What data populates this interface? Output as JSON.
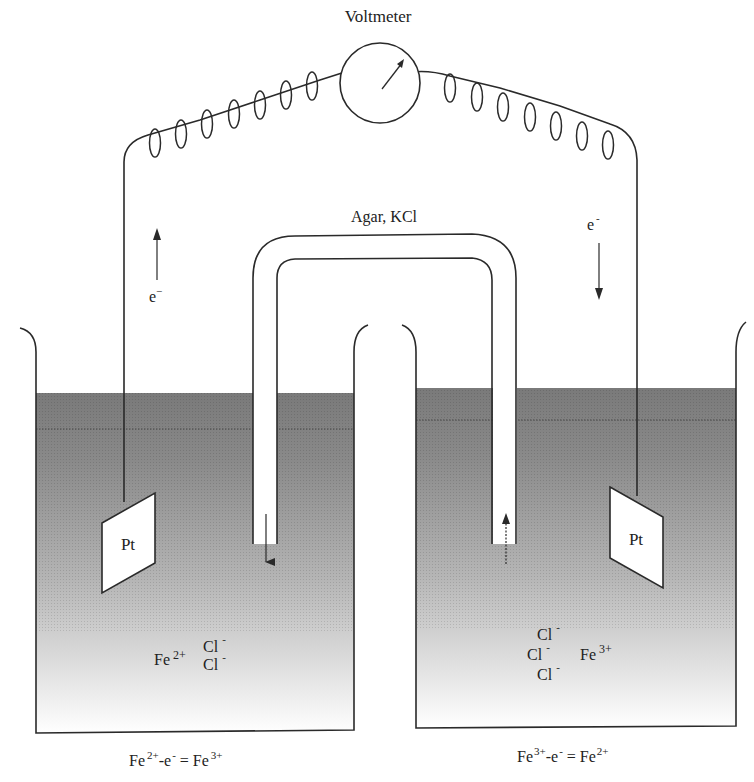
{
  "diagram": {
    "title": "Voltmeter",
    "salt_bridge_label": "Agar, KCl",
    "left_electron_label": "e",
    "left_electron_charge": "−",
    "right_electron_label": "e",
    "right_electron_charge": "-",
    "left_electrode_label": "Pt",
    "right_electrode_label": "Pt",
    "left_solution": {
      "cation": "Fe",
      "cation_charge": "2+",
      "anions": [
        {
          "symbol": "Cl",
          "charge": "-"
        },
        {
          "symbol": "Cl",
          "charge": "-"
        }
      ]
    },
    "right_solution": {
      "anions": [
        {
          "symbol": "Cl",
          "charge": "-"
        },
        {
          "symbol": "Cl",
          "charge": "-"
        },
        {
          "symbol": "Cl",
          "charge": "-"
        }
      ],
      "cation": "Fe",
      "cation_charge": "3+"
    },
    "left_reaction": {
      "reactant": "Fe",
      "reactant_charge": "2+",
      "minus_e": "-e",
      "e_charge": "-",
      "equals": " = Fe",
      "product_charge": "3+"
    },
    "right_reaction": {
      "reactant": "Fe",
      "reactant_charge": "3+",
      "minus_e": "-e",
      "e_charge": "-",
      "equals": " = Fe",
      "product_charge": "2+"
    },
    "colors": {
      "line": "#2a2a2a",
      "solution_dark": "#7f7f7f",
      "solution_light": "#ffffff",
      "background": "#ffffff"
    }
  }
}
